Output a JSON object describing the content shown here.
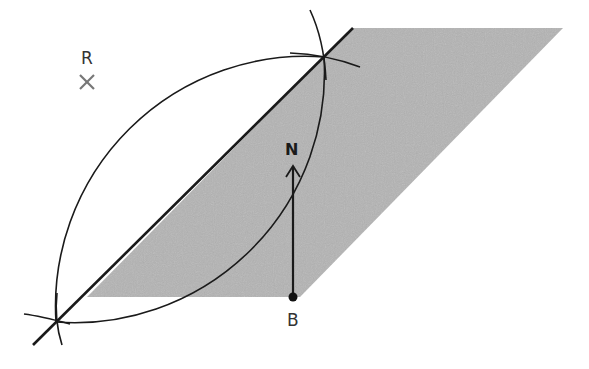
{
  "diagram": {
    "type": "geometric construction (perpendicular bisector / locus)",
    "labels": {
      "point_r": "R",
      "point_b": "B",
      "north": "N"
    },
    "colors": {
      "shaded_region": "#b4b4b4",
      "lines": "#1a1a1a",
      "cross_marker": "#777777",
      "background": "#ffffff"
    },
    "elements": [
      {
        "name": "shaded-region",
        "shape": "parallelogram",
        "vertices": [
          [
            87,
            297
          ],
          [
            353,
            28
          ],
          [
            563,
            28
          ],
          [
            300,
            297
          ]
        ]
      },
      {
        "name": "bisector-line",
        "from": [
          33,
          345
        ],
        "to": [
          353,
          28
        ]
      },
      {
        "name": "construction-arc-left",
        "from": [
          56,
          322
        ],
        "to": [
          324,
          57
        ]
      },
      {
        "name": "construction-arc-right",
        "from": [
          56,
          322
        ],
        "to": [
          324,
          57
        ]
      },
      {
        "name": "north-arrow",
        "from": [
          293,
          297
        ],
        "to": [
          293,
          165
        ]
      },
      {
        "name": "point-b",
        "at": [
          293,
          297
        ]
      },
      {
        "name": "point-r",
        "at": [
          87,
          82
        ]
      }
    ]
  }
}
